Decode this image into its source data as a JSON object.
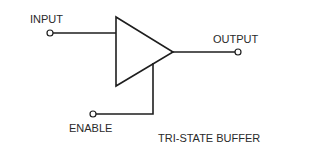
{
  "diagram": {
    "title": "TRI-STATE BUFFER",
    "labels": {
      "input": "INPUT",
      "output": "OUTPUT",
      "enable": "ENABLE"
    },
    "components": [
      {
        "type": "buffer-triangle",
        "name": "tri-state buffer"
      }
    ],
    "terminals": [
      "input",
      "output",
      "enable"
    ],
    "colors": {
      "line": "#1e1e1e",
      "text": "#2a2a2a",
      "background": "#ffffff"
    }
  }
}
